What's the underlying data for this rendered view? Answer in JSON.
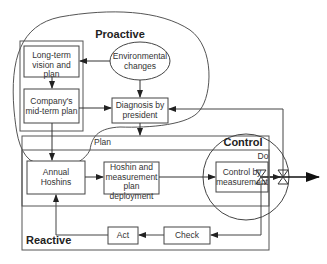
{
  "diagram": {
    "regions": {
      "proactive": "Proactive",
      "reactive": "Reactive",
      "plan": "Plan",
      "control": "Control",
      "do": "Do"
    },
    "nodes": {
      "long_term": "Long-term vision and plan",
      "environmental": "Environmental changes",
      "mid_term": "Company's mid-term plan",
      "diagnosis": "Diagnosis by president",
      "annual": "Annual Hoshins",
      "deployment": "Hoshin and measurement plan deployment",
      "control_by": "Control by measurement",
      "act": "Act",
      "check": "Check"
    },
    "edges": [
      {
        "from": "Environmental changes",
        "to": "Long-term vision and plan"
      },
      {
        "from": "Environmental changes",
        "to": "Diagnosis by president"
      },
      {
        "from": "Long-term vision and plan",
        "to": "Company's mid-term plan"
      },
      {
        "from": "Company's mid-term plan",
        "to": "Diagnosis by president"
      },
      {
        "from": "Company's mid-term plan",
        "to": "Annual Hoshins"
      },
      {
        "from": "Diagnosis by president",
        "to": "Plan"
      },
      {
        "from": "Annual Hoshins",
        "to": "Hoshin and measurement plan deployment"
      },
      {
        "from": "Hoshin and measurement plan deployment",
        "to": "Control by measurement"
      },
      {
        "from": "Control by measurement",
        "to": "Output"
      },
      {
        "from": "Control by measurement",
        "to": "Check"
      },
      {
        "from": "Check",
        "to": "Act"
      },
      {
        "from": "Act",
        "to": "Annual Hoshins"
      },
      {
        "from": "Output",
        "to": "Diagnosis by president"
      }
    ]
  }
}
